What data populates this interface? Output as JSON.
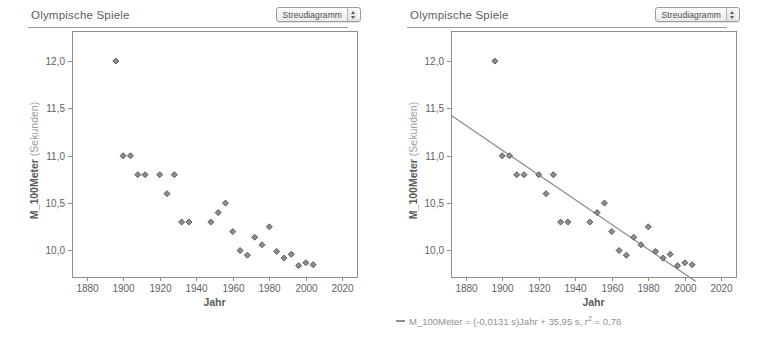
{
  "panels": [
    {
      "title": "Olympische Spiele",
      "plot_type_select": {
        "value": "Streudiagramm",
        "stepper_icon": "stepper-up-down-icon"
      },
      "show_fit": false,
      "legend": null
    },
    {
      "title": "Olympische Spiele",
      "plot_type_select": {
        "value": "Streudiagramm",
        "stepper_icon": "stepper-up-down-icon"
      },
      "show_fit": true,
      "legend": {
        "prefix": "M_100Meter = (-0,0131 s)Jahr + 35,95 s, r",
        "exponent": "2",
        "suffix": " = 0,78",
        "full": "M_100Meter = (-0,0131 s)Jahr + 35,95 s, r2 = 0,78"
      }
    }
  ],
  "chart_data": {
    "type": "scatter",
    "title": "Olympische Spiele",
    "xlabel": "Jahr",
    "ylabel_bold": "M_100Meter",
    "ylabel_unit": "(Sekunden)",
    "ylabel": "M_100Meter (Sekunden)",
    "xlim": [
      1872,
      2028
    ],
    "ylim": [
      9.72,
      12.18
    ],
    "xticks": [
      1880,
      1900,
      1920,
      1940,
      1960,
      1980,
      2000,
      2020
    ],
    "xticklabels": [
      "1880",
      "1900",
      "1920",
      "1940",
      "1960",
      "1980",
      "2000",
      "2020"
    ],
    "yticks": [
      10.0,
      10.5,
      11.0,
      11.5,
      12.0
    ],
    "yticklabels": [
      "10,0",
      "10,5",
      "11,0",
      "11,5",
      "12,0"
    ],
    "grid": false,
    "legend_position": "below",
    "x": [
      1896,
      1900,
      1904,
      1908,
      1912,
      1920,
      1924,
      1928,
      1932,
      1936,
      1948,
      1952,
      1956,
      1960,
      1964,
      1968,
      1972,
      1976,
      1980,
      1984,
      1988,
      1992,
      1996,
      2000,
      2004
    ],
    "y": [
      12.0,
      11.0,
      11.0,
      10.8,
      10.8,
      10.8,
      10.6,
      10.8,
      10.3,
      10.3,
      10.3,
      10.4,
      10.5,
      10.2,
      10.0,
      9.95,
      10.14,
      10.06,
      10.25,
      9.99,
      9.92,
      9.96,
      9.84,
      9.87,
      9.85
    ],
    "fit": {
      "slope": -0.0131,
      "intercept": 35.95,
      "r2": 0.78,
      "x_start": 1872,
      "x_end": 2006,
      "label": "M_100Meter = (-0,0131 s)Jahr + 35,95 s, r2 = 0,78"
    }
  }
}
